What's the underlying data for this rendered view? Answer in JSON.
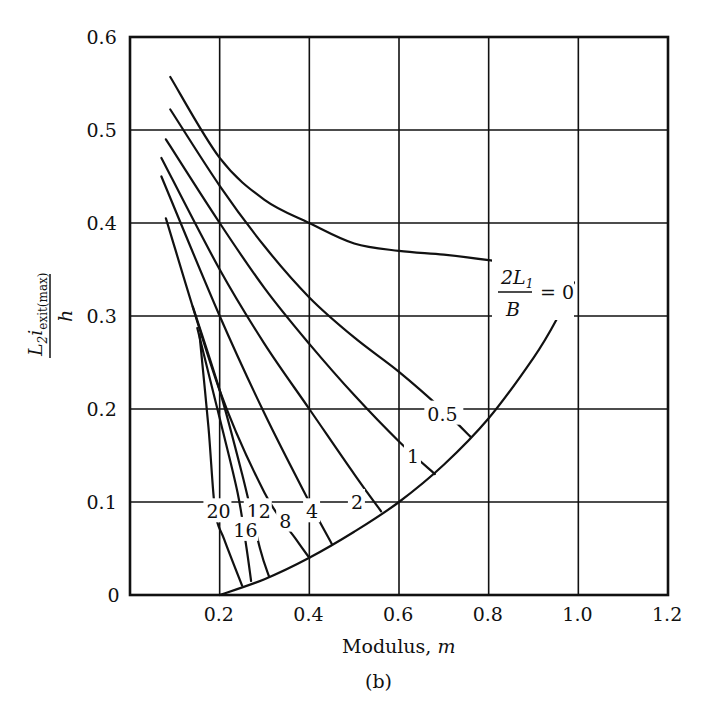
{
  "chart_data": {
    "type": "line",
    "title": "",
    "subtitle": "(b)",
    "xlabel": "Modulus, m",
    "ylabel": "L2 i_exit(max) / h",
    "xlim": [
      0,
      1.2
    ],
    "ylim": [
      0,
      0.6
    ],
    "grid": true,
    "x_ticks": [
      "0.2",
      "0.4",
      "0.6",
      "0.8",
      "1.0",
      "1.2"
    ],
    "y_ticks": [
      "0",
      "0.1",
      "0.2",
      "0.3",
      "0.4",
      "0.5",
      "0.6"
    ],
    "legend_parameter": "2L1/B",
    "series": [
      {
        "name": "2L1/B = 0",
        "label": "0",
        "points": [
          [
            0.09,
            0.557
          ],
          [
            0.2,
            0.47
          ],
          [
            0.3,
            0.425
          ],
          [
            0.4,
            0.4
          ],
          [
            0.5,
            0.378
          ],
          [
            0.6,
            0.37
          ],
          [
            0.7,
            0.366
          ],
          [
            0.8,
            0.36
          ],
          [
            0.9,
            0.352
          ],
          [
            0.99,
            0.336
          ]
        ]
      },
      {
        "name": "2L1/B = 0.5",
        "label": "0.5",
        "points": [
          [
            0.09,
            0.522
          ],
          [
            0.2,
            0.44
          ],
          [
            0.3,
            0.375
          ],
          [
            0.4,
            0.32
          ],
          [
            0.5,
            0.277
          ],
          [
            0.6,
            0.24
          ],
          [
            0.7,
            0.198
          ],
          [
            0.76,
            0.17
          ]
        ]
      },
      {
        "name": "2L1/B = 1",
        "label": "1",
        "points": [
          [
            0.08,
            0.49
          ],
          [
            0.2,
            0.4
          ],
          [
            0.3,
            0.33
          ],
          [
            0.4,
            0.27
          ],
          [
            0.5,
            0.215
          ],
          [
            0.6,
            0.165
          ],
          [
            0.68,
            0.13
          ]
        ]
      },
      {
        "name": "2L1/B = 2",
        "label": "2",
        "points": [
          [
            0.07,
            0.47
          ],
          [
            0.2,
            0.35
          ],
          [
            0.3,
            0.27
          ],
          [
            0.4,
            0.2
          ],
          [
            0.5,
            0.13
          ],
          [
            0.56,
            0.09
          ]
        ]
      },
      {
        "name": "2L1/B = 4",
        "label": "4",
        "points": [
          [
            0.07,
            0.45
          ],
          [
            0.2,
            0.3
          ],
          [
            0.3,
            0.195
          ],
          [
            0.4,
            0.1
          ],
          [
            0.45,
            0.055
          ]
        ]
      },
      {
        "name": "2L1/B = 8",
        "label": "8",
        "points": [
          [
            0.08,
            0.405
          ],
          [
            0.2,
            0.22
          ],
          [
            0.3,
            0.11
          ],
          [
            0.37,
            0.06
          ],
          [
            0.4,
            0.04
          ]
        ]
      },
      {
        "name": "2L1/B = 12",
        "label": "12",
        "points": [
          [
            0.14,
            0.31
          ],
          [
            0.2,
            0.22
          ],
          [
            0.25,
            0.13
          ],
          [
            0.29,
            0.05
          ],
          [
            0.31,
            0.02
          ]
        ]
      },
      {
        "name": "2L1/B = 16",
        "label": "16",
        "points": [
          [
            0.15,
            0.287
          ],
          [
            0.2,
            0.19
          ],
          [
            0.24,
            0.11
          ],
          [
            0.26,
            0.05
          ],
          [
            0.27,
            0.015
          ]
        ]
      },
      {
        "name": "2L1/B = 20",
        "label": "20",
        "points": [
          [
            0.155,
            0.28
          ],
          [
            0.175,
            0.18
          ],
          [
            0.19,
            0.09
          ],
          [
            0.21,
            0.06
          ],
          [
            0.25,
            0.01
          ]
        ]
      },
      {
        "name": "boundary",
        "label": "",
        "points": [
          [
            0.2,
            0.0
          ],
          [
            0.3,
            0.017
          ],
          [
            0.4,
            0.04
          ],
          [
            0.5,
            0.068
          ],
          [
            0.6,
            0.1
          ],
          [
            0.7,
            0.14
          ],
          [
            0.8,
            0.19
          ],
          [
            0.9,
            0.255
          ],
          [
            0.95,
            0.295
          ],
          [
            0.99,
            0.336
          ]
        ]
      }
    ],
    "annotations": [
      {
        "text": "2L1/B = 0",
        "x": 0.9,
        "y": 0.33
      },
      {
        "text": "0.5",
        "x": 0.7,
        "y": 0.195
      },
      {
        "text": "1",
        "x": 0.63,
        "y": 0.15
      },
      {
        "text": "2",
        "x": 0.505,
        "y": 0.1
      },
      {
        "text": "4",
        "x": 0.405,
        "y": 0.09
      },
      {
        "text": "8",
        "x": 0.345,
        "y": 0.08
      },
      {
        "text": "12",
        "x": 0.285,
        "y": 0.09
      },
      {
        "text": "16",
        "x": 0.255,
        "y": 0.07
      },
      {
        "text": "20",
        "x": 0.195,
        "y": 0.09
      }
    ]
  }
}
